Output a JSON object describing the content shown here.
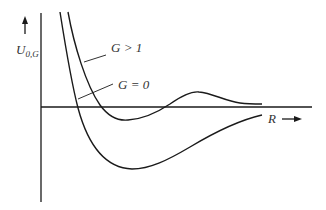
{
  "diagram": {
    "title": "",
    "y_axis": {
      "label_main": "U",
      "label_subscript": "0,G",
      "arrow": "up-arrow"
    },
    "x_axis": {
      "label": "R",
      "arrow": "right-arrow"
    },
    "curves": [
      {
        "id": "g-greater-than-1",
        "label": "G > 1",
        "shape": "repulsive wall, shallow well below zero, barrier maximum above zero, then decays toward zero from above"
      },
      {
        "id": "g-equals-0",
        "label": "G = 0",
        "shape": "repulsive wall, deep well below zero, then rises toward zero from below"
      }
    ],
    "colors": {
      "line": "#1a1a1a",
      "text": "#333333",
      "background": "#ffffff"
    }
  }
}
